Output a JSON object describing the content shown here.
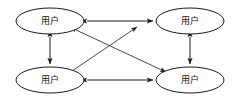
{
  "diagram": {
    "type": "node-link-graph",
    "background_color": "#ffffff",
    "line_color": "#1a1a1a",
    "nodes": [
      {
        "id": "tl",
        "label": "用户",
        "cx": 50,
        "cy": 21,
        "rx": 34,
        "ry": 13
      },
      {
        "id": "tr",
        "label": "用户",
        "cx": 190,
        "cy": 21,
        "rx": 34,
        "ry": 13
      },
      {
        "id": "bl",
        "label": "用户",
        "cx": 50,
        "cy": 80,
        "rx": 34,
        "ry": 13
      },
      {
        "id": "br",
        "label": "用户",
        "cx": 190,
        "cy": 80,
        "rx": 34,
        "ry": 13
      }
    ],
    "edges": [
      {
        "id": "top-horizontal",
        "from": "tl",
        "to": "tr",
        "direction": "bidirectional"
      },
      {
        "id": "bottom-horizontal",
        "from": "bl",
        "to": "br",
        "direction": "bidirectional"
      },
      {
        "id": "left-vertical",
        "from": "tl",
        "to": "bl",
        "direction": "bidirectional"
      },
      {
        "id": "right-vertical",
        "from": "tr",
        "to": "br",
        "direction": "bidirectional"
      },
      {
        "id": "diagonal-tl-br",
        "from": "tl",
        "to": "br",
        "direction": "bidirectional"
      },
      {
        "id": "diagonal-bl-tr",
        "from": "bl",
        "to": "tr",
        "direction": "forward"
      }
    ]
  }
}
